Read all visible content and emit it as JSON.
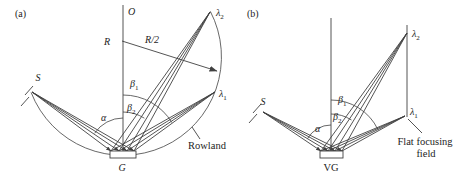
{
  "diagram": {
    "background": "#ffffff",
    "ink": "#414141",
    "text_color": "#1d1d1d",
    "panels": {
      "a": {
        "tag": "(a)",
        "center_label": "O",
        "radius_label": "R",
        "half_radius_label": "R/2",
        "source_label": "S",
        "grating_label": "G",
        "alpha": "α",
        "beta": "β",
        "beta1_sub": "1",
        "beta2_sub": "2",
        "lambda": "λ",
        "lambda1_sub": "1",
        "lambda2_sub": "2",
        "circle_label": "Rowland"
      },
      "b": {
        "tag": "(b)",
        "source_label": "S",
        "grating_label": "VG",
        "alpha": "α",
        "beta": "β",
        "beta1_sub": "1",
        "beta2_sub": "2",
        "lambda": "λ",
        "lambda1_sub": "1",
        "lambda2_sub": "2",
        "field_label_line1": "Flat focusing",
        "field_label_line2": "field"
      }
    }
  }
}
